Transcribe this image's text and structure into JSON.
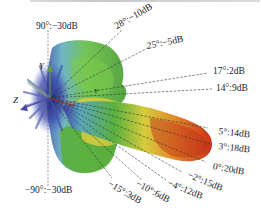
{
  "figure": {
    "type": "3D radiation pattern",
    "colors": {
      "low": "#2a2a9a",
      "mid_low": "#5aa8b8",
      "mid": "#4aa83a",
      "mid_high": "#d8c83a",
      "high": "#d8401a"
    },
    "axes": {
      "y_label": "Y",
      "z_label": "Z",
      "x_label": "X"
    },
    "annotations": [
      {
        "angle": "90°",
        "gain": "-30dB",
        "text": "90°:−30dB"
      },
      {
        "angle": "28°",
        "gain": "-10dB",
        "text": "28°:−10dB"
      },
      {
        "angle": "25°",
        "gain": "-5dB",
        "text": "25°:−5dB"
      },
      {
        "angle": "17°",
        "gain": "2dB",
        "text": "17°:2dB"
      },
      {
        "angle": "14°",
        "gain": "9dB",
        "text": "14°:9dB"
      },
      {
        "angle": "5°",
        "gain": "14dB",
        "text": "5°:14dB"
      },
      {
        "angle": "3°",
        "gain": "18dB",
        "text": "3°:18dB"
      },
      {
        "angle": "0°",
        "gain": "20dB",
        "text": "0°:20dB"
      },
      {
        "angle": "-2°",
        "gain": "15dB",
        "text": "−2°:15dB"
      },
      {
        "angle": "-4°",
        "gain": "12dB",
        "text": "−4°:12dB"
      },
      {
        "angle": "-10°",
        "gain": "6dB",
        "text": "−10°:6dB"
      },
      {
        "angle": "-15°",
        "gain": "3dB",
        "text": "−15°:3dB"
      },
      {
        "angle": "-90°",
        "gain": "-30dB",
        "text": "−90°:−30dB"
      }
    ]
  }
}
